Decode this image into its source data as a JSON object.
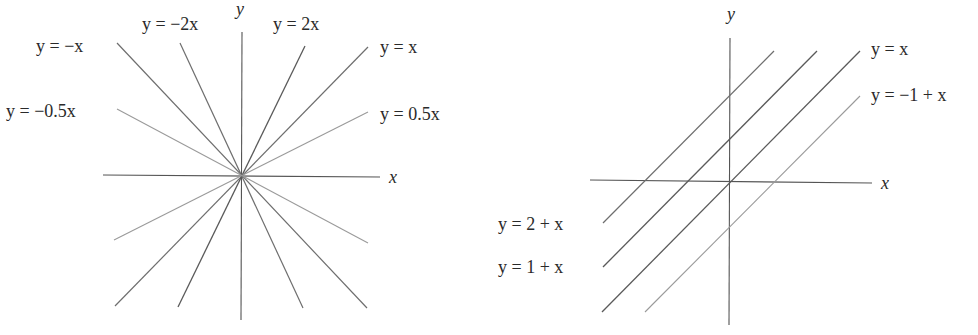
{
  "left_figure": {
    "axis_labels": {
      "x": "x",
      "y": "y"
    },
    "lines": [
      {
        "label": "y = −x",
        "slope": -1
      },
      {
        "label": "y = −2x",
        "slope": -2
      },
      {
        "label": "y = 2x",
        "slope": 2
      },
      {
        "label": "y = x",
        "slope": 1
      },
      {
        "label": "y = −0.5x",
        "slope": -0.5
      },
      {
        "label": "y = 0.5x",
        "slope": 0.5
      }
    ]
  },
  "right_figure": {
    "axis_labels": {
      "x": "x",
      "y": "y"
    },
    "lines": [
      {
        "label": "y = x",
        "intercept": 0
      },
      {
        "label": "y = −1 + x",
        "intercept": -1
      },
      {
        "label": "y = 2 + x",
        "intercept": 2
      },
      {
        "label": "y = 1 + x",
        "intercept": 1
      }
    ]
  }
}
